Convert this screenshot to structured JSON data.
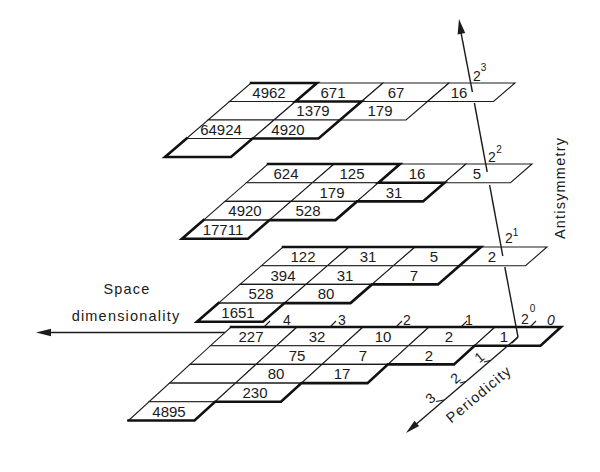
{
  "axes": {
    "space_dimensionality": {
      "label": [
        "Space",
        "dimensionality"
      ],
      "ticks": [
        "4",
        "3",
        "2",
        "1",
        "0"
      ]
    },
    "periodicity": {
      "label": "Periodicity",
      "ticks": [
        "1",
        "2",
        "3"
      ]
    },
    "antisymmetry": {
      "label": "Antisymmetry",
      "levels": [
        {
          "base": "2",
          "exp": "0"
        },
        {
          "base": "2",
          "exp": "1"
        },
        {
          "base": "2",
          "exp": "2"
        },
        {
          "base": "2",
          "exp": "3"
        }
      ]
    }
  },
  "planes": [
    {
      "antisymmetry_level": "2^0",
      "columns_dimension": [
        "4",
        "3",
        "2",
        "1",
        "0"
      ],
      "rows": [
        [
          "227",
          "32",
          "10",
          "2",
          "1"
        ],
        [
          "",
          "75",
          "7",
          "2"
        ],
        [
          "",
          "80",
          "17"
        ],
        [
          "",
          "230"
        ],
        [
          "4895"
        ]
      ]
    },
    {
      "antisymmetry_level": "2^1",
      "columns_dimension": [
        "3",
        "2",
        "1",
        "0"
      ],
      "rows": [
        [
          "122",
          "31",
          "5",
          "2"
        ],
        [
          "394",
          "31",
          "7"
        ],
        [
          "528",
          "80"
        ],
        [
          "1651"
        ]
      ]
    },
    {
      "antisymmetry_level": "2^2",
      "columns_dimension": [
        "3",
        "2",
        "1",
        "0"
      ],
      "rows": [
        [
          "624",
          "125",
          "16",
          "5"
        ],
        [
          "",
          "179",
          "31"
        ],
        [
          "4920",
          "528"
        ],
        [
          "17711"
        ]
      ]
    },
    {
      "antisymmetry_level": "2^3",
      "columns_dimension": [
        "3",
        "2",
        "1",
        "0"
      ],
      "rows": [
        [
          "4962",
          "671",
          "67",
          "16"
        ],
        [
          "",
          "1379",
          "179"
        ],
        [
          "64924",
          "4920"
        ],
        [
          ""
        ]
      ]
    }
  ],
  "colors": {
    "line": "#1c1c1c",
    "background": "#ffffff"
  }
}
